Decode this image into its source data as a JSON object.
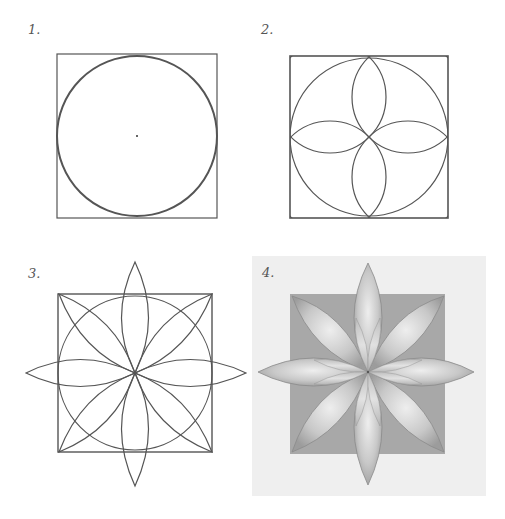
{
  "panels": [
    {
      "label": "1.",
      "description": "Square with inscribed circle and marked center point"
    },
    {
      "label": "2.",
      "description": "Square with four quarter-circle arcs centered on corners forming four overlapping petals"
    },
    {
      "label": "3.",
      "description": "Eight-petal rosette construction extending beyond the square"
    },
    {
      "label": "4.",
      "description": "Shaded eight-petal flower over a gray square"
    }
  ],
  "colors": {
    "line": "#4a4a4a",
    "shade_dark": "#9a9a9a",
    "shade_light": "#e4e4e4",
    "paper": "#ffffff",
    "panel4_bg": "#efefef"
  }
}
